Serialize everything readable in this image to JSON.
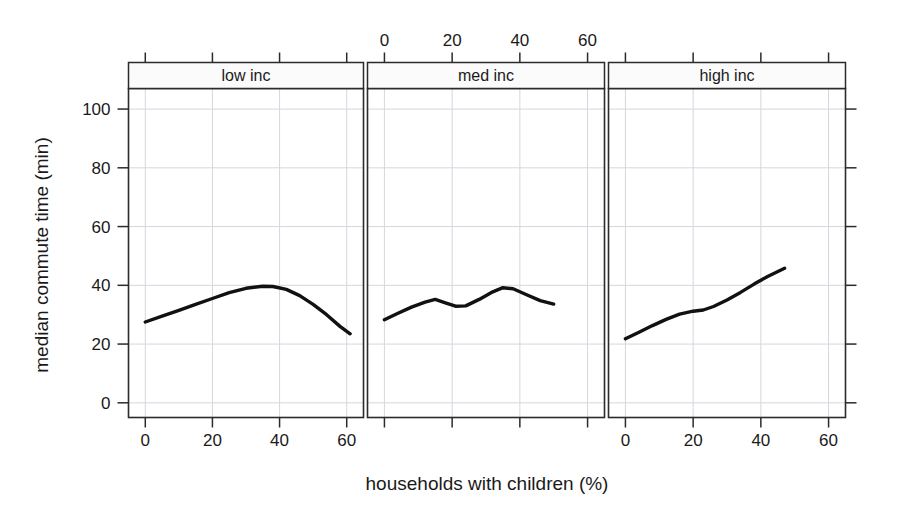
{
  "figure": {
    "title": "",
    "background_color": "#ffffff",
    "point_color": "#bdbdbd",
    "line_color": "#111111",
    "grid_color": "#d6d6de",
    "frame_color": "#2b2b2b"
  },
  "axes": {
    "y_title": "median commute time (min)",
    "x_title": "households with children (%)",
    "y_ticks": [
      "0",
      "20",
      "40",
      "60",
      "80",
      "100"
    ],
    "x_ticks_bottom_left": [
      "0",
      "20",
      "40",
      "60"
    ],
    "x_ticks_top_middle": [
      "0",
      "20",
      "40",
      "60"
    ],
    "x_ticks_bottom_right": [
      "0",
      "20",
      "40",
      "60"
    ]
  },
  "strips": [
    {
      "label": "low inc"
    },
    {
      "label": "med inc"
    },
    {
      "label": "high inc"
    }
  ],
  "chart_data": {
    "type": "scatter",
    "title": "",
    "xlabel": "households with children (%)",
    "ylabel": "median commute time (min)",
    "xlim": [
      -5,
      65
    ],
    "ylim": [
      -5,
      107
    ],
    "grid": true,
    "legend": "none",
    "layout": "trellis-3-panels-horizontal",
    "panel_variable": "income group",
    "panels": [
      {
        "name": "low inc",
        "x_tick_position": "bottom",
        "xticks": [
          0,
          20,
          40,
          60
        ],
        "yticks": [
          0,
          20,
          40,
          60,
          80,
          100
        ],
        "n_points_approx": 1400,
        "point_cloud": {
          "x_range": [
            0,
            62
          ],
          "y_range": [
            2,
            100
          ],
          "x_center": 27,
          "y_center": 32,
          "x_sd": 11,
          "y_sd": 9,
          "description": "dense gray cloud centered near 27% children / 32 min, long right tail to 62%, scattered outliers up to 100 min"
        },
        "trend_line": {
          "name": "loess smooth",
          "x": [
            0,
            5,
            10,
            15,
            20,
            25,
            30,
            35,
            38,
            42,
            46,
            50,
            54,
            58,
            61
          ],
          "y": [
            27.5,
            29.5,
            31.5,
            33.5,
            35.5,
            37.5,
            39.0,
            39.7,
            39.6,
            38.6,
            36.5,
            33.5,
            30.0,
            26.0,
            23.5
          ]
        }
      },
      {
        "name": "med inc",
        "x_tick_position": "top",
        "xticks": [
          0,
          20,
          40,
          60
        ],
        "yticks": [
          0,
          20,
          40,
          60,
          80,
          100
        ],
        "n_points_approx": 1200,
        "point_cloud": {
          "x_range": [
            0,
            51
          ],
          "y_range": [
            8,
            64
          ],
          "x_center": 22,
          "y_center": 33,
          "x_sd": 9,
          "y_sd": 9,
          "description": "gray cloud centered near 22% children / 33 min, compact, tail to 51%"
        },
        "trend_line": {
          "name": "loess smooth",
          "x": [
            0,
            4,
            8,
            12,
            15,
            18,
            21,
            24,
            28,
            32,
            35,
            38,
            42,
            46,
            50
          ],
          "y": [
            28.3,
            30.5,
            32.6,
            34.3,
            35.2,
            34.0,
            32.9,
            33.0,
            35.2,
            37.8,
            39.2,
            38.8,
            36.8,
            34.8,
            33.6
          ]
        }
      },
      {
        "name": "high inc",
        "x_tick_position": "bottom",
        "xticks": [
          0,
          20,
          40,
          60
        ],
        "yticks": [
          0,
          20,
          40,
          60,
          80,
          100
        ],
        "n_points_approx": 1100,
        "point_cloud": {
          "x_range": [
            0,
            48
          ],
          "y_range": [
            8,
            58
          ],
          "x_center": 22,
          "y_center": 32,
          "x_sd": 8,
          "y_sd": 8,
          "description": "gray cloud centered near 22% children / 32 min, rising with x"
        },
        "trend_line": {
          "name": "loess smooth",
          "x": [
            0,
            4,
            8,
            12,
            16,
            20,
            23,
            26,
            30,
            34,
            38,
            42,
            47
          ],
          "y": [
            21.8,
            24.0,
            26.3,
            28.4,
            30.2,
            31.2,
            31.6,
            32.8,
            35.0,
            37.6,
            40.4,
            43.0,
            45.8
          ]
        }
      }
    ]
  }
}
